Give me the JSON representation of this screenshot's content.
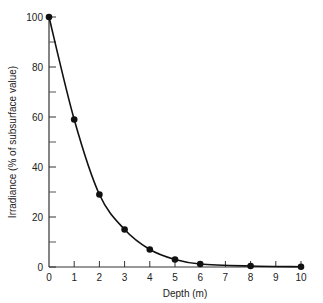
{
  "chart_data": {
    "type": "line",
    "title": "",
    "xlabel": "Depth (m)",
    "ylabel": "Irradiance (% of subsurface value)",
    "xlim": [
      0,
      10
    ],
    "ylim": [
      0,
      100
    ],
    "x_ticks": [
      0,
      1,
      2,
      3,
      4,
      5,
      6,
      7,
      8,
      9,
      10
    ],
    "y_ticks_labeled": [
      0,
      20,
      40,
      60,
      80,
      100
    ],
    "y_ticks_minor": [
      10,
      30,
      50,
      70,
      90
    ],
    "grid": false,
    "legend": null,
    "series": [
      {
        "name": "Irradiance",
        "x": [
          0,
          1,
          2,
          3,
          4,
          5,
          6,
          8,
          10
        ],
        "values": [
          100,
          59,
          29,
          15,
          7,
          3,
          1.2,
          0.4,
          0.1
        ],
        "marker": "circle",
        "smooth": true,
        "color": "#111111"
      }
    ]
  }
}
